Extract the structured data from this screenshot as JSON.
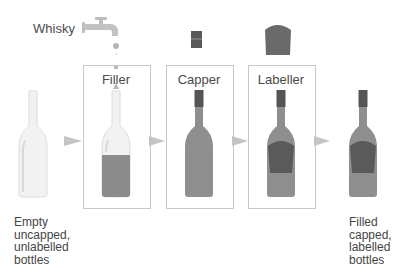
{
  "source_label": "Whisky",
  "stations": [
    {
      "label": "Filler"
    },
    {
      "label": "Capper"
    },
    {
      "label": "Labeller"
    }
  ],
  "input_caption": [
    "Empty",
    "uncapped,",
    "unlabelled",
    "bottles"
  ],
  "output_caption": [
    "Filled",
    "capped,",
    "labelled",
    "bottles"
  ],
  "colors": {
    "liquid": "#8c8c8c",
    "cap": "#555555",
    "label": "#5a5a5a",
    "glass": "#f1f1f1",
    "arrow": "#c4c4c4",
    "box_border": "#c8c8c8"
  }
}
